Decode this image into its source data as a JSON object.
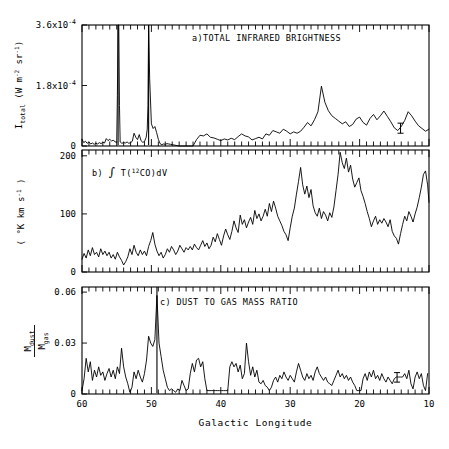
{
  "figure": {
    "xaxis_title": "Galactic Longitude",
    "background": "#ffffff",
    "ink": "#000000"
  },
  "chart_data": [
    {
      "type": "line",
      "panel": "a",
      "title": "a)TOTAL INFRARED BRIGHTNESS",
      "xlabel": "Galactic Longitude",
      "ylabel": "I_total (W m^-2 sr^-1)",
      "ylabel_parts": {
        "main": "I",
        "main_sub": "total",
        "unit_open": " (W m",
        "unit_sup1": "-2",
        "unit_mid": "sr",
        "unit_sup2": "-1",
        "unit_close": ")"
      },
      "xlim": [
        60,
        10
      ],
      "ylim": [
        0,
        0.00036
      ],
      "xticks": [
        60,
        50,
        40,
        30,
        20,
        10
      ],
      "xticklabels": [
        "60",
        "50",
        "40",
        "30",
        "20",
        "10"
      ],
      "yticks": [
        0,
        0.00018,
        0.00036
      ],
      "yticklabels": [
        "0",
        "1.8x10",
        "3.6x10"
      ],
      "ytick_exponents": [
        "",
        "-4",
        "-4"
      ],
      "grid": false,
      "minor_tick_step": 1,
      "error_bar": {
        "x": 14.1,
        "y": 5.3e-05,
        "err": 1.5e-05
      },
      "x": [
        60.0,
        59.75,
        59.5,
        59.25,
        59.0,
        58.75,
        58.5,
        58.25,
        58.0,
        57.75,
        57.5,
        57.25,
        57.0,
        56.75,
        56.5,
        56.25,
        56.0,
        55.75,
        55.5,
        55.25,
        55.0,
        54.9,
        54.8,
        54.7,
        54.6,
        54.5,
        54.25,
        54.0,
        53.75,
        53.5,
        53.25,
        53.0,
        52.75,
        52.5,
        52.25,
        52.0,
        51.75,
        51.5,
        51.25,
        51.0,
        50.75,
        50.6,
        50.5,
        50.4,
        50.25,
        50.0,
        49.75,
        49.5,
        49.25,
        49.0,
        48.75,
        48.5,
        48.25,
        48.0,
        47.75,
        47.5,
        47.25,
        47.0,
        46.0,
        45.0,
        44.0,
        43.5,
        43.0,
        42.5,
        42.0,
        41.5,
        41.0,
        40.5,
        40.0,
        39.5,
        39.0,
        38.5,
        38.0,
        37.5,
        37.0,
        36.5,
        36.0,
        35.5,
        35.0,
        34.5,
        34.0,
        33.5,
        33.0,
        32.5,
        32.0,
        31.5,
        31.0,
        30.5,
        30.0,
        29.5,
        29.0,
        28.5,
        28.0,
        27.5,
        27.0,
        26.5,
        26.0,
        25.5,
        25.0,
        24.5,
        24.0,
        23.5,
        23.0,
        22.5,
        22.0,
        21.5,
        21.0,
        20.5,
        20.0,
        19.5,
        19.0,
        18.5,
        18.0,
        17.5,
        17.0,
        16.5,
        16.0,
        15.5,
        15.0,
        14.5,
        14.0,
        13.5,
        13.0,
        12.5,
        12.0,
        11.5,
        11.0,
        10.5,
        10.0
      ],
      "y": [
        2e-05,
        1e-05,
        1.4e-05,
        8e-06,
        1.2e-05,
        6e-06,
        9e-06,
        5e-06,
        8e-06,
        6e-06,
        1e-05,
        7e-06,
        1.1e-05,
        9e-06,
        2.2e-05,
        1.6e-05,
        2e-05,
        1.5e-05,
        1.7e-05,
        1.3e-05,
        1e-05,
        0.00015,
        0.00036,
        0.00036,
        0.00012,
        1.2e-05,
        8e-06,
        1e-05,
        9e-06,
        1.2e-05,
        8e-06,
        1e-05,
        1.4e-05,
        3.8e-05,
        2.6e-05,
        1.9e-05,
        3.4e-05,
        1.6e-05,
        1.1e-05,
        1.3e-05,
        2.6e-05,
        5e-05,
        0.00012,
        0.00036,
        0.0002,
        6.6e-05,
        5.2e-05,
        5.8e-05,
        4e-05,
        2e-05,
        7e-06,
        4e-06,
        6e-06,
        5e-06,
        7e-06,
        6e-06,
        5e-06,
        4e-06,
        0.0,
        0.0,
        0.0,
        1.9e-05,
        3.2e-05,
        3e-05,
        3.6e-05,
        2.6e-05,
        2.4e-05,
        2e-05,
        1.6e-05,
        2.1e-05,
        1.8e-05,
        2.3e-05,
        1.9e-05,
        2.8e-05,
        3.6e-05,
        3e-05,
        2.7e-05,
        1.8e-05,
        2.2e-05,
        2.6e-05,
        2.1e-05,
        3.6e-05,
        3.2e-05,
        4.6e-05,
        4.2e-05,
        3.8e-05,
        5e-05,
        4.4e-05,
        3.6e-05,
        4.2e-05,
        3.8e-05,
        4.4e-05,
        5.6e-05,
        7e-05,
        6e-05,
        7.8e-05,
        0.000102,
        0.000178,
        0.00013,
        0.000105,
        9e-05,
        8.2e-05,
        7.4e-05,
        6.6e-05,
        7.2e-05,
        5.8e-05,
        6.4e-05,
        8e-05,
        8.6e-05,
        7e-05,
        6.2e-05,
        8.2e-05,
        9.4e-05,
        7.8e-05,
        9e-05,
        0.000104,
        8.8e-05,
        7.2e-05,
        5.4e-05,
        4.6e-05,
        5.8e-05,
        7.6e-05,
        0.000102,
        9e-05,
        7.4e-05,
        6e-05,
        5.2e-05,
        4.4e-05,
        5e-05,
        3.2e-05
      ],
      "clipped_peaks": [
        {
          "x": 54.8,
          "note": "off-scale spike"
        },
        {
          "x": 50.4,
          "note": "off-scale spike"
        }
      ]
    },
    {
      "type": "line",
      "panel": "b",
      "title": "b)  ∫ T(12CO)dV",
      "title_parts": {
        "label": "b)",
        "integral": "∫",
        "t_open": " T(",
        "sup": "12",
        "species": "CO)dV"
      },
      "xlabel": "Galactic Longitude",
      "ylabel": "( °K km s^-1 )",
      "ylabel_parts": {
        "open": "( ",
        "deg": "°",
        "mid": "K km s",
        "sup": "-1",
        "close": " )"
      },
      "xlim": [
        60,
        10
      ],
      "ylim": [
        0,
        210
      ],
      "xticks": [
        60,
        50,
        40,
        30,
        20,
        10
      ],
      "yticks": [
        0,
        100,
        200
      ],
      "yticklabels": [
        "0",
        "100",
        "200"
      ],
      "grid": false,
      "minor_tick_step": 1,
      "x": [
        60.0,
        59.7,
        59.4,
        59.1,
        58.8,
        58.5,
        58.2,
        57.9,
        57.6,
        57.3,
        57.0,
        56.7,
        56.4,
        56.1,
        55.8,
        55.5,
        55.2,
        54.9,
        54.6,
        54.3,
        54.0,
        53.7,
        53.4,
        53.1,
        52.8,
        52.5,
        52.2,
        51.9,
        51.6,
        51.3,
        51.0,
        50.7,
        50.4,
        50.1,
        49.8,
        49.5,
        49.2,
        48.9,
        48.6,
        48.3,
        48.0,
        47.7,
        47.4,
        47.1,
        46.8,
        46.5,
        46.2,
        45.9,
        45.6,
        45.3,
        45.0,
        44.7,
        44.4,
        44.1,
        43.8,
        43.5,
        43.2,
        42.9,
        42.6,
        42.3,
        42.0,
        41.7,
        41.4,
        41.1,
        40.8,
        40.5,
        40.2,
        39.9,
        39.6,
        39.3,
        39.0,
        38.7,
        38.4,
        38.1,
        37.8,
        37.5,
        37.2,
        36.9,
        36.6,
        36.3,
        36.0,
        35.7,
        35.4,
        35.1,
        34.8,
        34.5,
        34.2,
        33.9,
        33.6,
        33.3,
        33.0,
        32.7,
        32.4,
        32.1,
        31.8,
        31.5,
        31.2,
        30.9,
        30.6,
        30.3,
        30.0,
        29.7,
        29.4,
        29.1,
        28.8,
        28.5,
        28.2,
        27.9,
        27.6,
        27.3,
        27.0,
        26.7,
        26.4,
        26.1,
        25.8,
        25.5,
        25.2,
        24.9,
        24.6,
        24.3,
        24.0,
        23.7,
        23.4,
        23.1,
        22.8,
        22.5,
        22.2,
        21.9,
        21.6,
        21.3,
        21.0,
        20.7,
        20.4,
        20.1,
        19.8,
        19.5,
        19.2,
        18.9,
        18.6,
        18.3,
        18.0,
        17.7,
        17.4,
        17.1,
        16.8,
        16.5,
        16.2,
        15.9,
        15.6,
        15.3,
        15.0,
        14.7,
        14.4,
        14.1,
        13.8,
        13.5,
        13.2,
        12.9,
        12.6,
        12.3,
        12.0,
        11.7,
        11.4,
        11.1,
        10.8,
        10.5,
        10.2,
        10.0
      ],
      "y": [
        22,
        32,
        24,
        38,
        28,
        42,
        30,
        34,
        26,
        40,
        30,
        36,
        28,
        34,
        24,
        30,
        22,
        34,
        26,
        20,
        12,
        18,
        26,
        40,
        30,
        46,
        34,
        28,
        38,
        30,
        36,
        28,
        44,
        54,
        68,
        48,
        36,
        28,
        34,
        24,
        30,
        40,
        34,
        44,
        38,
        30,
        36,
        46,
        40,
        34,
        42,
        38,
        44,
        38,
        48,
        42,
        38,
        46,
        54,
        44,
        50,
        40,
        46,
        60,
        52,
        66,
        56,
        46,
        62,
        74,
        64,
        56,
        70,
        88,
        76,
        68,
        98,
        82,
        90,
        76,
        86,
        94,
        82,
        106,
        92,
        100,
        88,
        96,
        108,
        96,
        118,
        104,
        122,
        110,
        96,
        88,
        80,
        70,
        64,
        54,
        76,
        96,
        110,
        134,
        156,
        180,
        150,
        134,
        148,
        128,
        142,
        114,
        102,
        96,
        110,
        92,
        104,
        98,
        88,
        102,
        94,
        112,
        140,
        168,
        206,
        188,
        178,
        196,
        172,
        184,
        160,
        146,
        154,
        162,
        140,
        130,
        118,
        104,
        92,
        78,
        88,
        96,
        82,
        90,
        84,
        92,
        86,
        78,
        90,
        70,
        62,
        58,
        48,
        66,
        82,
        96,
        88,
        104,
        96,
        86,
        100,
        112,
        128,
        146,
        168,
        174,
        150,
        120,
        96,
        78
      ]
    },
    {
      "type": "line",
      "panel": "c",
      "title": "c)  DUST TO GAS MASS RATIO",
      "xlabel": "Galactic Longitude",
      "ylabel": "M_dust / M_gas",
      "ylabel_parts": {
        "num_main": "M",
        "num_sub": "dust",
        "den_main": "M",
        "den_sub": "gas"
      },
      "xlim": [
        60,
        10
      ],
      "ylim": [
        0,
        0.063
      ],
      "xticks": [
        60,
        50,
        40,
        30,
        20,
        10
      ],
      "xticklabels": [
        "60",
        "50",
        "40",
        "30",
        "20",
        "10"
      ],
      "yticks": [
        0,
        0.03,
        0.06
      ],
      "yticklabels": [
        "0",
        "0.03",
        "0.06"
      ],
      "grid": false,
      "minor_tick_step": 1,
      "error_bar": {
        "x": 14.6,
        "y": 0.0098,
        "err": 0.0028
      },
      "x": [
        60.0,
        59.7,
        59.4,
        59.1,
        58.8,
        58.5,
        58.2,
        57.9,
        57.6,
        57.3,
        57.0,
        56.7,
        56.4,
        56.1,
        55.8,
        55.5,
        55.2,
        54.9,
        54.6,
        54.3,
        54.0,
        53.7,
        53.4,
        53.1,
        52.8,
        52.5,
        52.2,
        51.9,
        51.6,
        51.3,
        51.0,
        50.7,
        50.4,
        50.1,
        49.8,
        49.5,
        49.2,
        48.9,
        48.6,
        48.3,
        48.0,
        47.7,
        47.4,
        47.1,
        46.8,
        46.5,
        46.2,
        45.9,
        45.6,
        45.3,
        45.0,
        44.7,
        44.4,
        44.1,
        43.8,
        43.5,
        43.2,
        42.9,
        42.6,
        42.3,
        42.0,
        41.7,
        41.4,
        41.1,
        40.8,
        40.5,
        40.2,
        39.9,
        39.6,
        39.3,
        39.0,
        38.7,
        38.4,
        38.1,
        37.8,
        37.5,
        37.2,
        36.9,
        36.6,
        36.3,
        36.0,
        35.7,
        35.4,
        35.1,
        34.8,
        34.5,
        34.2,
        33.9,
        33.6,
        33.3,
        33.0,
        32.7,
        32.4,
        32.1,
        31.8,
        31.5,
        31.2,
        30.9,
        30.6,
        30.3,
        30.0,
        29.7,
        29.4,
        29.1,
        28.8,
        28.5,
        28.2,
        27.9,
        27.6,
        27.3,
        27.0,
        26.7,
        26.4,
        26.1,
        25.8,
        25.5,
        25.2,
        24.9,
        24.6,
        24.3,
        24.0,
        23.7,
        23.4,
        23.1,
        22.8,
        22.5,
        22.2,
        21.9,
        21.6,
        21.3,
        21.0,
        20.7,
        20.4,
        20.1,
        19.8,
        19.5,
        19.2,
        18.9,
        18.6,
        18.3,
        18.0,
        17.7,
        17.4,
        17.1,
        16.8,
        16.5,
        16.2,
        15.9,
        15.6,
        15.3,
        15.0,
        14.7,
        14.4,
        14.1,
        13.8,
        13.5,
        13.2,
        12.9,
        12.6,
        12.3,
        12.0,
        11.7,
        11.4,
        11.1,
        10.8,
        10.5,
        10.2,
        10.0
      ],
      "y": [
        0.002,
        0.009,
        0.021,
        0.013,
        0.019,
        0.008,
        0.014,
        0.01,
        0.016,
        0.011,
        0.013,
        0.008,
        0.012,
        0.015,
        0.01,
        0.014,
        0.009,
        0.016,
        0.012,
        0.027,
        0.016,
        0.01,
        0.006,
        0.001,
        0.004,
        0.013,
        0.009,
        0.014,
        0.01,
        0.007,
        0.012,
        0.02,
        0.034,
        0.03,
        0.028,
        0.032,
        0.058,
        0.03,
        0.022,
        0.014,
        0.009,
        0.004,
        0.002,
        0.003,
        0.002,
        0.001,
        0.003,
        0.002,
        0.008,
        0.005,
        0.002,
        0.003,
        0.012,
        0.018,
        0.013,
        0.02,
        0.021,
        0.016,
        0.019,
        0.009,
        0.002,
        0.002,
        0.002,
        0.002,
        0.002,
        0.002,
        0.002,
        0.002,
        0.002,
        0.002,
        0.002,
        0.016,
        0.019,
        0.016,
        0.018,
        0.013,
        0.017,
        0.009,
        0.012,
        0.03,
        0.019,
        0.011,
        0.016,
        0.01,
        0.014,
        0.007,
        0.006,
        0.008,
        0.005,
        0.004,
        0.002,
        0.004,
        0.008,
        0.01,
        0.007,
        0.011,
        0.009,
        0.013,
        0.01,
        0.008,
        0.011,
        0.009,
        0.007,
        0.013,
        0.018,
        0.014,
        0.01,
        0.008,
        0.012,
        0.009,
        0.011,
        0.008,
        0.013,
        0.016,
        0.012,
        0.01,
        0.008,
        0.01,
        0.007,
        0.006,
        0.005,
        0.008,
        0.011,
        0.014,
        0.01,
        0.012,
        0.009,
        0.011,
        0.008,
        0.01,
        0.007,
        0.005,
        0.002,
        0.002,
        0.002,
        0.009,
        0.012,
        0.008,
        0.013,
        0.01,
        0.014,
        0.009,
        0.011,
        0.008,
        0.012,
        0.009,
        0.007,
        0.01,
        0.008,
        0.006,
        0.009,
        0.01,
        0.01,
        0.01,
        0.01,
        0.012,
        0.009,
        0.014,
        0.006,
        0.003,
        0.01,
        0.013,
        0.009,
        0.012,
        0.005,
        0.002,
        0.012
      ],
      "clipped_peaks": [
        {
          "x": 49.2,
          "note": "spike exceeding 0.06"
        }
      ]
    }
  ]
}
